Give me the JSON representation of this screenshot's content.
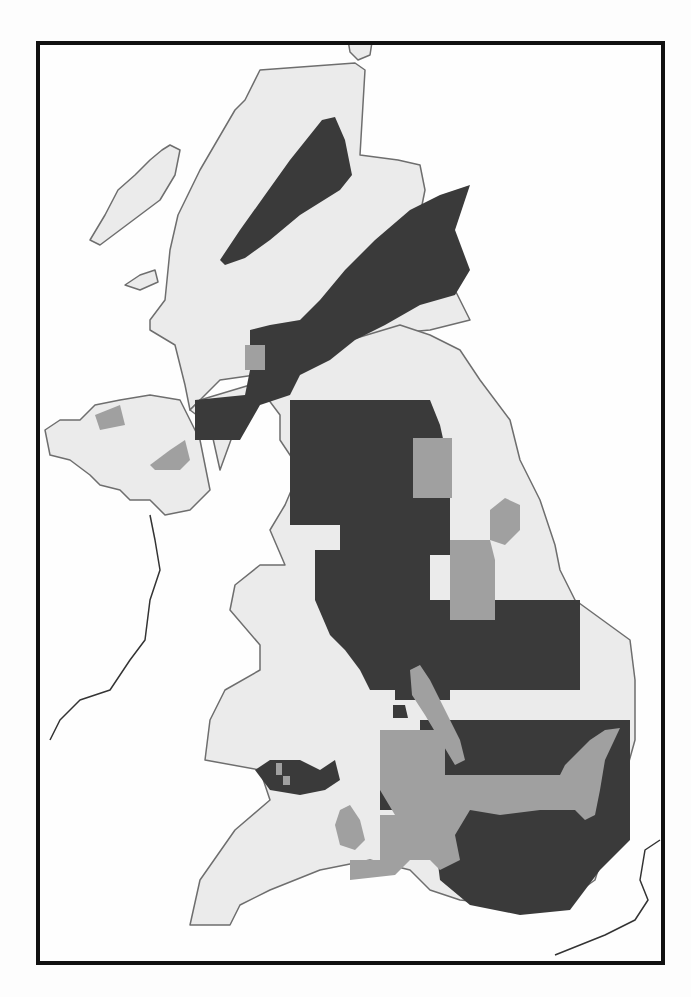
{
  "map": {
    "frame": {
      "x": 36,
      "y": 41,
      "width": 625,
      "height": 920,
      "border_color": "#111111"
    },
    "colors": {
      "background": "#fefefe",
      "land": "#ebebeb",
      "coastline": "#6e6e6e",
      "foreign_coast": "#333333",
      "rivers": "#b4b4b4",
      "dark_region": "#3a3a3a",
      "gray_region": "#a0a0a0"
    },
    "land": [
      {
        "name": "scotland-north",
        "points": "150,320 165,300 170,250 178,215 200,170 235,110 245,100 260,70 355,63 365,70 360,155 398,160 420,165 425,190 420,215 410,260 425,265 455,290 470,320 430,330 375,335 350,340 300,350 290,360 255,375 220,380 200,400 190,410 185,385 175,345 150,330"
      },
      {
        "name": "great-britain-main",
        "points": "190,410 200,400 250,385 255,375 290,355 310,345 350,340 400,325 430,335 460,350 480,380 510,420 520,460 540,500 555,545 560,570 575,600 630,640 635,680 635,740 610,830 595,880 560,905 510,905 460,900 430,890 410,870 370,860 320,870 270,890 240,905 230,925 190,925 200,880 235,830 270,800 260,770 205,760 210,720 225,690 260,670 260,645 230,610 235,585 260,565 285,565 270,530 285,505 300,470 280,440 280,415 265,395 240,415 220,470 210,425"
      },
      {
        "name": "northern-ireland",
        "points": "45,430 60,420 80,420 95,405 120,400 150,395 180,400 200,440 210,490 190,510 165,515 150,500 130,500 120,490 100,485 90,475 70,460 50,455"
      },
      {
        "name": "outer-hebrides",
        "points": "90,240 105,215 118,190 135,175 150,160 162,150 170,145 180,150 175,175 160,200 140,215 120,230 100,245"
      },
      {
        "name": "skye-island",
        "points": "125,285 140,275 155,270 158,282 140,290"
      },
      {
        "name": "orkney",
        "points": "348,40 360,38 372,42 370,55 358,60 350,52"
      }
    ],
    "dark_regions": [
      {
        "name": "great-glen-band",
        "points": "220,260 240,230 265,195 290,160 322,120 335,117 345,140 352,175 340,190 300,215 270,240 245,258 225,265"
      },
      {
        "name": "midland-valley-band",
        "points": "250,330 270,325 300,320 320,300 345,270 375,240 410,210 440,195 470,185 455,230 470,270 455,295 420,305 385,325 355,340 330,360 300,375 290,395 260,405 240,440 195,440 195,400 245,395 250,370"
      },
      {
        "name": "northern-england-block",
        "points": "290,400 430,400 440,425 450,470 450,555 430,555 430,600 580,600 580,690 450,690 450,700 395,700 395,690 370,690 360,670 345,650 330,635 315,600 315,550 340,550 340,525 290,525 290,435"
      },
      {
        "name": "east-anglia-block",
        "points": "450,600 580,600 580,690 450,690"
      },
      {
        "name": "south-east-block",
        "points": "420,720 630,720 630,840 600,870 570,910 520,915 470,905 440,880 435,840 460,820 470,790 450,780 420,780"
      },
      {
        "name": "wales-south-blob",
        "points": "255,770 270,760 300,760 320,770 335,760 340,780 325,790 300,795 270,790"
      },
      {
        "name": "severn-small-block",
        "points": "380,790 400,790 405,800 400,810 380,810"
      },
      {
        "name": "midlands-small-block",
        "points": "393,705 405,705 408,718 393,718"
      }
    ],
    "gray_regions": [
      {
        "name": "yorkshire-block",
        "points": "413,438 452,438 452,498 413,498"
      },
      {
        "name": "lincs-strip",
        "points": "450,540 490,540 495,560 495,620 450,620"
      },
      {
        "name": "humber-patch",
        "points": "490,510 505,498 520,505 520,530 505,545 490,540"
      },
      {
        "name": "scotland-lowland-patch",
        "points": "245,345 265,345 265,370 245,370"
      },
      {
        "name": "ni-patch-west",
        "points": "95,415 120,405 125,425 100,430"
      },
      {
        "name": "ni-patch-east",
        "points": "150,465 170,450 185,440 190,460 180,470 155,470"
      },
      {
        "name": "trent-strip",
        "points": "410,670 420,665 430,680 440,700 450,720 460,740 465,760 455,765 440,740 425,715 412,695"
      },
      {
        "name": "oxford-belt",
        "points": "380,730 445,730 445,775 480,775 480,775 560,775 565,765 590,740 605,730 620,728 605,760 600,790 595,815 585,820 575,810 560,810 540,810 500,815 470,810 455,835 460,860 440,870 430,860 410,860 395,875 350,880 350,860 380,860 380,815 395,815 380,790"
      },
      {
        "name": "bristol-patch",
        "points": "340,810 350,805 360,820 365,840 355,850 340,845 335,825"
      },
      {
        "name": "wales-small-patches",
        "points": "276,763 282,763 282,775 276,775"
      },
      {
        "name": "wales-small-patch-2",
        "points": "283,776 290,776 290,785 283,785"
      }
    ],
    "foreign_coast": [
      {
        "name": "ireland-east-coast",
        "points": "150,515 155,540 160,570 150,600 145,640 130,660 110,690 80,700 60,720 50,740"
      },
      {
        "name": "france-coast",
        "points": "660,840 645,850 640,880 648,900 635,920 605,935 580,945 555,955"
      }
    ]
  }
}
